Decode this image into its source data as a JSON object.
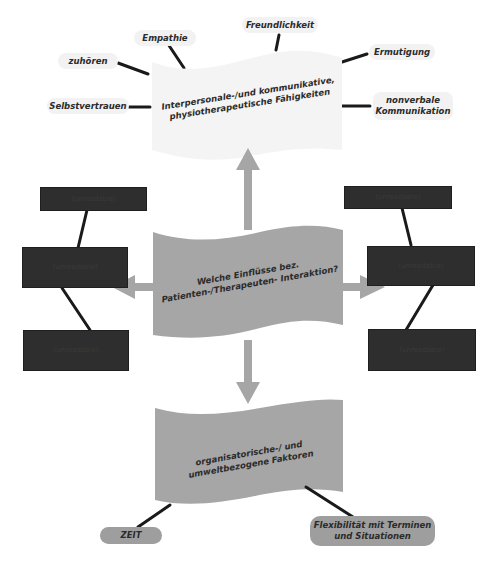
{
  "diagram": {
    "top_flag": {
      "label": "Interpersonale-/und kommunikative, physiotherapeutische Fähigkeiten",
      "line1": "Interpersonale-/und kommunikative,",
      "line2": "physiotherapeutische Fähigkeiten",
      "color": "#f4f4f4"
    },
    "top_nodes": [
      {
        "label": "Empathie"
      },
      {
        "label": "Freundlichkeit"
      },
      {
        "label": "zuhören"
      },
      {
        "label": "Ermutigung"
      },
      {
        "label": "Selbstvertrauen"
      },
      {
        "label": "nonverbale Kommunikation",
        "line1": "nonverbale",
        "line2": "Kommunikation"
      }
    ],
    "center_flag": {
      "label": "Welche Einflüsse bez. Patienten-/Therapeuten- Interaktion?",
      "line1": "Welche Einflüsse bez.",
      "line2": "Patienten-/Therapeuten- Interaktion?",
      "color": "#a6a6a6"
    },
    "bottom_flag": {
      "label": "organisatorische-/ und umweltbezogene Faktoren",
      "line1": "organisatorische-/ und",
      "line2": "umweltbezogene Faktoren",
      "color": "#a6a6a6"
    },
    "bottom_nodes": [
      {
        "label": "ZEIT"
      },
      {
        "label": "Flexibilität mit Terminen und Situationen",
        "line1": "Flexibilität mit Terminen",
        "line2": "und Situationen"
      }
    ],
    "left_boxes": [
      {
        "label": "(unreadable)"
      },
      {
        "label": "(unreadable)"
      },
      {
        "label": "(unreadable)"
      }
    ],
    "right_boxes": [
      {
        "label": "(unreadable)"
      },
      {
        "label": "(unreadable)"
      },
      {
        "label": "(unreadable)"
      }
    ],
    "colors": {
      "arrow": "#a6a6a6",
      "connector": "#1a1a1a",
      "dark_box": "#2e2e2e",
      "pill_light": "#f2f2f2",
      "pill_gray": "#9e9e9e"
    }
  }
}
